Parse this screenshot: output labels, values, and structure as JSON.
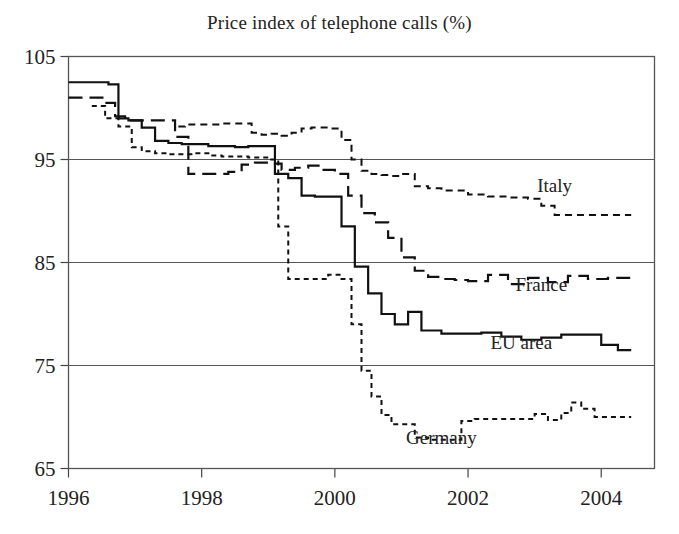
{
  "chart_data": {
    "type": "line",
    "title": "Price index of telephone calls (%)",
    "xlabel": "",
    "ylabel": "",
    "xlim": [
      1996,
      2004.8
    ],
    "ylim": [
      65,
      105
    ],
    "xticks": [
      "1996",
      "1998",
      "2000",
      "2002",
      "2004"
    ],
    "xtick_values": [
      1996,
      1998,
      2000,
      2002,
      2004
    ],
    "yticks": [
      "105",
      "95",
      "85",
      "75",
      "65"
    ],
    "ytick_values": [
      105,
      95,
      85,
      75,
      65
    ],
    "grid": true,
    "grid_axis": "y",
    "legend_position": "inline-right-of-series",
    "series": [
      {
        "name": "Italy",
        "label": "Italy",
        "style": "short-dash",
        "dasharray": "7,5",
        "width": 2.0,
        "color": "#111111",
        "label_x": 2003.3,
        "label_y": 91.8,
        "x": [
          1997.65,
          1997.75,
          1997.9,
          1998.0,
          1998.15,
          1998.3,
          1998.45,
          1998.6,
          1998.75,
          1998.9,
          1999.05,
          1999.2,
          1999.35,
          1999.5,
          1999.65,
          1999.8,
          1999.95,
          2000.1,
          2000.25,
          2000.4,
          2000.55,
          2000.7,
          2000.85,
          2001.0,
          2001.2,
          2001.4,
          2001.6,
          2001.8,
          2002.0,
          2002.3,
          2002.6,
          2002.9,
          2003.1,
          2003.3,
          2003.6,
          2004.0,
          2004.45
        ],
        "y": [
          98.2,
          98.4,
          98.4,
          98.4,
          98.4,
          98.5,
          98.5,
          98.5,
          97.6,
          97.4,
          97.5,
          97.3,
          97.6,
          98.0,
          98.1,
          98.1,
          98.0,
          96.9,
          95.0,
          93.9,
          93.6,
          93.5,
          93.4,
          93.6,
          92.4,
          92.2,
          92.0,
          92.0,
          91.6,
          91.4,
          91.3,
          91.2,
          90.5,
          89.6,
          89.6,
          89.6,
          89.6
        ]
      },
      {
        "name": "France",
        "label": "France",
        "style": "long-dash",
        "dasharray": "14,7",
        "width": 2.2,
        "color": "#111111",
        "label_x": 2003.1,
        "label_y": 82.2,
        "x": [
          1996.0,
          1996.3,
          1996.55,
          1996.7,
          1996.85,
          1997.0,
          1997.2,
          1997.4,
          1997.6,
          1997.8,
          1998.0,
          1998.2,
          1998.4,
          1998.6,
          1998.8,
          1999.0,
          1999.2,
          1999.4,
          1999.6,
          1999.8,
          2000.0,
          2000.2,
          2000.4,
          2000.6,
          2000.8,
          2001.0,
          2001.2,
          2001.4,
          2001.6,
          2001.8,
          2002.0,
          2002.3,
          2002.6,
          2002.9,
          2003.2,
          2003.5,
          2003.8,
          2004.1,
          2004.45
        ],
        "y": [
          101.0,
          101.0,
          100.5,
          99.2,
          98.8,
          98.8,
          98.8,
          98.8,
          97.2,
          93.6,
          93.6,
          93.6,
          93.8,
          94.5,
          94.7,
          94.6,
          94.0,
          94.2,
          94.4,
          94.0,
          93.6,
          91.5,
          89.8,
          88.9,
          87.4,
          85.5,
          84.2,
          83.6,
          83.4,
          83.3,
          83.2,
          83.8,
          82.9,
          83.5,
          83.1,
          83.7,
          83.4,
          83.5,
          83.5
        ]
      },
      {
        "name": "EU area",
        "label": "EU area",
        "style": "solid",
        "dasharray": "none",
        "width": 2.2,
        "color": "#111111",
        "label_x": 2002.8,
        "label_y": 76.6,
        "x": [
          1996.0,
          1996.45,
          1996.6,
          1996.75,
          1996.9,
          1997.1,
          1997.3,
          1997.5,
          1997.7,
          1997.9,
          1998.1,
          1998.3,
          1998.5,
          1998.7,
          1998.9,
          1999.1,
          1999.3,
          1999.5,
          1999.7,
          1999.9,
          2000.1,
          2000.3,
          2000.5,
          2000.7,
          2000.9,
          2001.1,
          2001.3,
          2001.6,
          2001.9,
          2002.2,
          2002.5,
          2002.8,
          2003.1,
          2003.4,
          2003.7,
          2004.0,
          2004.25,
          2004.45
        ],
        "y": [
          102.5,
          102.5,
          102.3,
          99.0,
          98.8,
          98.1,
          96.8,
          96.6,
          96.5,
          96.5,
          96.3,
          96.3,
          96.2,
          96.3,
          96.3,
          93.6,
          93.2,
          91.5,
          91.4,
          91.4,
          88.5,
          84.6,
          82.0,
          80.0,
          79.0,
          80.2,
          78.4,
          78.1,
          78.1,
          78.2,
          77.8,
          77.5,
          77.7,
          78.0,
          78.0,
          77.0,
          76.5,
          76.5
        ]
      },
      {
        "name": "Germany",
        "label": "Germany",
        "style": "dotted-dash",
        "dasharray": "5,4",
        "width": 2.0,
        "color": "#111111",
        "label_x": 2001.6,
        "label_y": 67.4,
        "x": [
          1996.35,
          1996.55,
          1996.75,
          1996.95,
          1997.1,
          1997.3,
          1997.5,
          1997.7,
          1997.9,
          1998.1,
          1998.3,
          1998.5,
          1998.7,
          1998.9,
          1999.0,
          1999.15,
          1999.3,
          1999.5,
          1999.7,
          1999.9,
          2000.0,
          2000.1,
          2000.25,
          2000.4,
          2000.55,
          2000.7,
          2000.85,
          2001.0,
          2001.2,
          2001.4,
          2001.6,
          2001.75,
          2001.9,
          2002.1,
          2002.4,
          2002.7,
          2003.0,
          2003.2,
          2003.4,
          2003.55,
          2003.7,
          2003.9,
          2004.1,
          2004.45
        ],
        "y": [
          100.2,
          99.0,
          98.2,
          96.2,
          95.8,
          95.6,
          95.5,
          95.5,
          95.6,
          95.4,
          95.3,
          95.3,
          95.2,
          95.2,
          95.0,
          88.5,
          83.4,
          83.4,
          83.4,
          83.8,
          83.8,
          83.4,
          79.0,
          74.5,
          72.0,
          70.2,
          69.3,
          69.3,
          68.0,
          67.8,
          67.8,
          67.8,
          69.6,
          69.8,
          69.8,
          69.8,
          70.3,
          69.7,
          70.4,
          71.4,
          70.8,
          70.0,
          70.0,
          70.0
        ]
      }
    ]
  },
  "figure": {
    "background_color": "#ffffff",
    "axis_color": "#555555",
    "text_color": "#222222"
  }
}
